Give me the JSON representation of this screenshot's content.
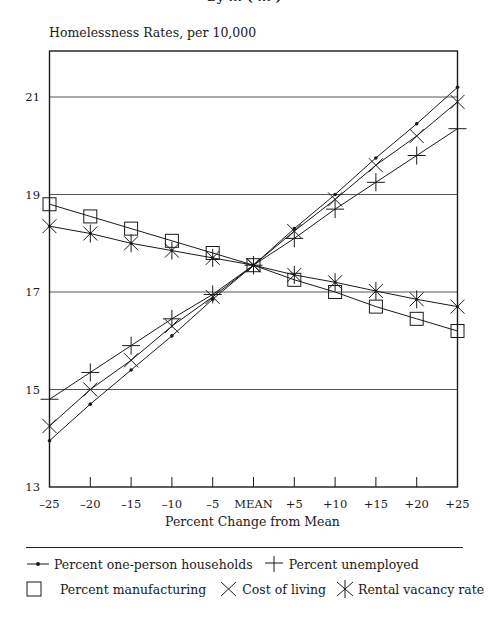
{
  "header": {
    "cropped_title": "by ... ( ... )"
  },
  "chart_data": {
    "type": "line",
    "title": "",
    "ylabel": "Homelessness Rates, per 10,000",
    "xlabel": "Percent Change from Mean",
    "categories": [
      "–25",
      "–20",
      "–15",
      "–10",
      "–5",
      "MEAN",
      "+5",
      "+10",
      "+15",
      "+20",
      "+25"
    ],
    "x": [
      -25,
      -20,
      -15,
      -10,
      -5,
      0,
      5,
      10,
      15,
      20,
      25
    ],
    "ylim": [
      13,
      22
    ],
    "yticks": [
      13,
      15,
      17,
      19,
      21
    ],
    "grid": "horizontal",
    "legend_position": "bottom",
    "series": [
      {
        "name": "Percent one-person households",
        "marker": "dot",
        "values": [
          13.95,
          14.7,
          15.4,
          16.1,
          16.85,
          17.55,
          18.3,
          19.0,
          19.75,
          20.45,
          21.2
        ]
      },
      {
        "name": "Percent unemployed",
        "marker": "plus",
        "values": [
          14.8,
          15.35,
          15.9,
          16.45,
          16.95,
          17.55,
          18.1,
          18.7,
          19.25,
          19.8,
          20.35
        ]
      },
      {
        "name": "Percent manufacturing",
        "marker": "square",
        "values": [
          18.8,
          18.55,
          18.3,
          18.05,
          17.8,
          17.55,
          17.25,
          17.0,
          16.7,
          16.45,
          16.2
        ]
      },
      {
        "name": "Cost of living",
        "marker": "x",
        "values": [
          14.25,
          15.0,
          15.6,
          16.3,
          16.9,
          17.55,
          18.25,
          18.9,
          19.6,
          20.2,
          20.9
        ]
      },
      {
        "name": "Rental vacancy rate",
        "marker": "asterisk",
        "values": [
          18.35,
          18.2,
          18.0,
          17.85,
          17.7,
          17.55,
          17.35,
          17.2,
          17.02,
          16.85,
          16.7
        ]
      }
    ]
  },
  "legend": {
    "row1": [
      {
        "label": "Percent one-person households",
        "icon": "dot-line-icon"
      },
      {
        "label": "Percent unemployed",
        "icon": "plus-icon"
      }
    ],
    "row2": [
      {
        "label": "Percent manufacturing",
        "icon": "square-icon"
      },
      {
        "label": "Cost of living",
        "icon": "x-icon"
      },
      {
        "label": "Rental vacancy rate",
        "icon": "asterisk-icon"
      }
    ]
  },
  "colors": {
    "ink": "#1a1a1a",
    "grid": "#555555",
    "background": "#ffffff"
  }
}
